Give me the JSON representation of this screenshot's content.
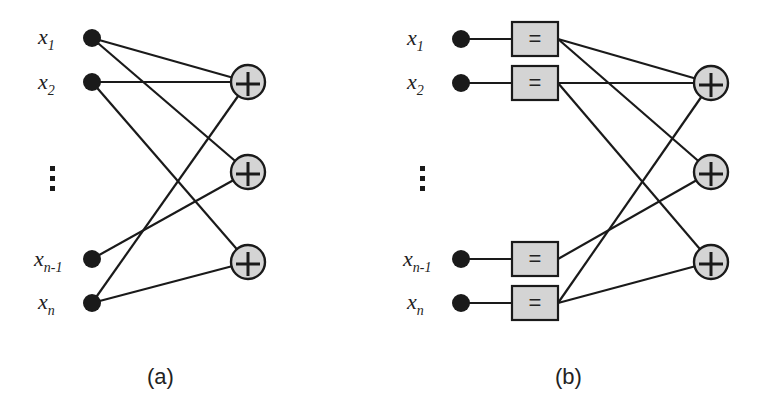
{
  "panels": [
    {
      "id": "a",
      "caption": "(a)",
      "inputs": [
        {
          "base": "x",
          "sub": "1"
        },
        {
          "base": "x",
          "sub": "2"
        },
        {
          "base": "x",
          "sub": "n-1"
        },
        {
          "base": "x",
          "sub": "n"
        }
      ],
      "ellipsis": "⋮",
      "adder_symbol": "+",
      "adder_count": 3
    },
    {
      "id": "b",
      "caption": "(b)",
      "inputs": [
        {
          "base": "x",
          "sub": "1"
        },
        {
          "base": "x",
          "sub": "2"
        },
        {
          "base": "x",
          "sub": "n-1"
        },
        {
          "base": "x",
          "sub": "n"
        }
      ],
      "ellipsis": "⋮",
      "equality_symbol": "=",
      "adder_symbol": "+",
      "adder_count": 3
    }
  ],
  "colors": {
    "node_fill": "#1a1a1a",
    "adder_fill": "#d4d4d4",
    "box_fill": "#d4d4d4",
    "stroke": "#1a1a1a"
  }
}
